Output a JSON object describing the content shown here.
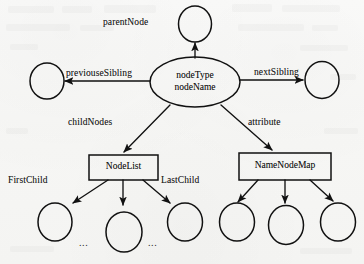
{
  "diagram": {
    "type": "node-graph",
    "ink_color": "#111111",
    "paper_color": "#f6f6f4",
    "center_node": {
      "id": "node",
      "shape": "ellipse",
      "line1": "nodeType",
      "line2": "nodeName"
    },
    "nodes": [
      {
        "id": "parent",
        "shape": "circle",
        "label": ""
      },
      {
        "id": "prev-sibling",
        "shape": "circle",
        "label": ""
      },
      {
        "id": "next-sibling",
        "shape": "circle",
        "label": ""
      },
      {
        "id": "nodelist",
        "shape": "rect",
        "label": "NodeList"
      },
      {
        "id": "namenodemap",
        "shape": "rect",
        "label": "NameNodeMap"
      },
      {
        "id": "child-first",
        "shape": "circle",
        "label": ""
      },
      {
        "id": "child-middle",
        "shape": "circle",
        "label": ""
      },
      {
        "id": "child-last",
        "shape": "circle",
        "label": ""
      },
      {
        "id": "attr-first",
        "shape": "circle",
        "label": ""
      },
      {
        "id": "attr-middle",
        "shape": "circle",
        "label": ""
      },
      {
        "id": "attr-last",
        "shape": "circle",
        "label": ""
      }
    ],
    "edge_labels": {
      "parent_node": "parentNode",
      "previous_sibling": "previouseSibling",
      "next_sibling": "nextSibling",
      "child_nodes": "childNodes",
      "attribute": "attribute",
      "first_child": "FirstChild",
      "last_child": "LastChild"
    },
    "box_labels": {
      "node_list": "NodeList",
      "name_node_map": "NameNodeMap"
    },
    "ellipsis": {
      "left": "...",
      "right": "..."
    },
    "edges": [
      {
        "from": "node",
        "to": "parent",
        "label": "parentNode",
        "arrow": "to"
      },
      {
        "from": "node",
        "to": "prev-sibling",
        "label": "previouseSibling",
        "arrow": "to"
      },
      {
        "from": "node",
        "to": "next-sibling",
        "label": "nextSibling",
        "arrow": "to"
      },
      {
        "from": "node",
        "to": "nodelist",
        "label": "childNodes",
        "arrow": "to"
      },
      {
        "from": "node",
        "to": "namenodemap",
        "label": "attribute",
        "arrow": "to"
      },
      {
        "from": "nodelist",
        "to": "child-first",
        "label": "FirstChild",
        "arrow": "to"
      },
      {
        "from": "nodelist",
        "to": "child-middle",
        "label": "",
        "arrow": "to"
      },
      {
        "from": "nodelist",
        "to": "child-last",
        "label": "LastChild",
        "arrow": "to"
      },
      {
        "from": "namenodemap",
        "to": "attr-first",
        "label": "",
        "arrow": "to"
      },
      {
        "from": "namenodemap",
        "to": "attr-middle",
        "label": "",
        "arrow": "to"
      },
      {
        "from": "namenodemap",
        "to": "attr-last",
        "label": "",
        "arrow": "to"
      }
    ]
  }
}
